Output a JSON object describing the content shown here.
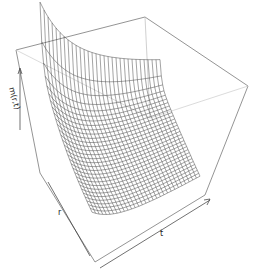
{
  "chart_data": {
    "type": "surface3d",
    "title": "",
    "xlabel": "r",
    "ylabel": "t",
    "zlabel": "m(r,t)",
    "style": "wireframe perspective (persp)",
    "grid_resolution": {
      "r": 30,
      "t": 30
    },
    "colors": {
      "mesh": "#333333",
      "box": "#555555",
      "background": "#ffffff"
    },
    "box_corners": {
      "back_left_top": [
        16,
        50
      ],
      "back_top": [
        145,
        17
      ],
      "right_top": [
        248,
        86
      ],
      "right_bottom": [
        205,
        195
      ],
      "front_bottom": [
        95,
        262
      ],
      "left_bottom": [
        38,
        175
      ]
    }
  },
  "labels": {
    "z": "m(r,t)",
    "r": "r",
    "t": "t"
  }
}
